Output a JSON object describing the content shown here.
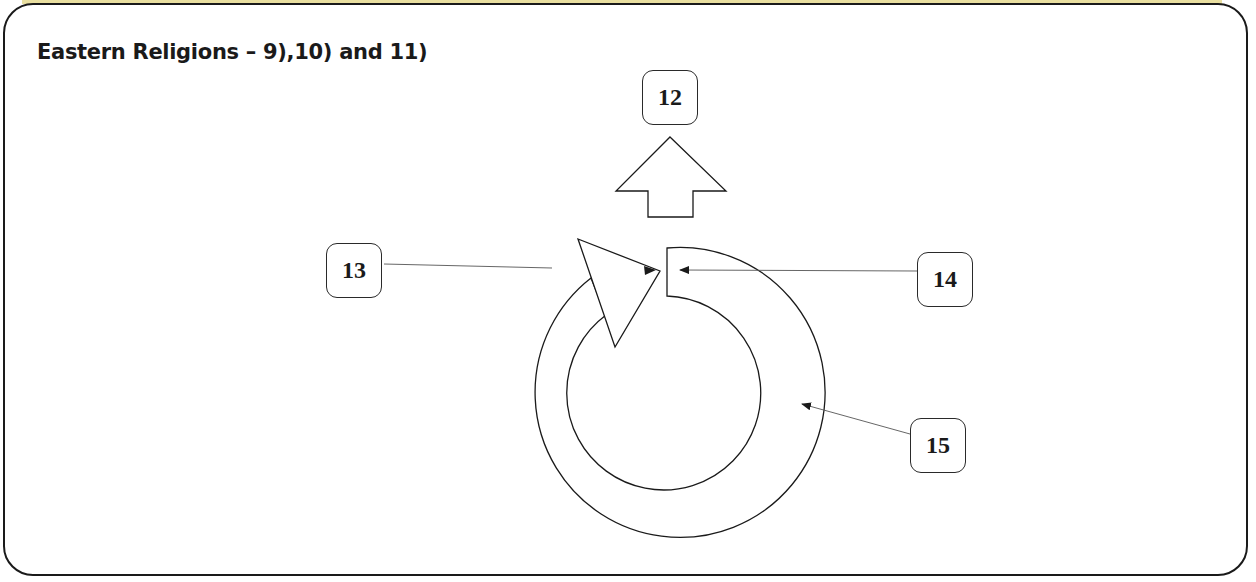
{
  "title": "Eastern Religions – 9),10) and 11)",
  "labels": [
    {
      "id": "12",
      "text": "12",
      "target": "up-arrow"
    },
    {
      "id": "13",
      "text": "13",
      "target": "arrow-head-triangle"
    },
    {
      "id": "14",
      "text": "14",
      "target": "cycle-ring-start"
    },
    {
      "id": "15",
      "text": "15",
      "target": "cycle-ring"
    }
  ],
  "colors": {
    "stroke": "#1a1a1a",
    "frame_accent": "#e9dfa0",
    "background": "#ffffff"
  }
}
